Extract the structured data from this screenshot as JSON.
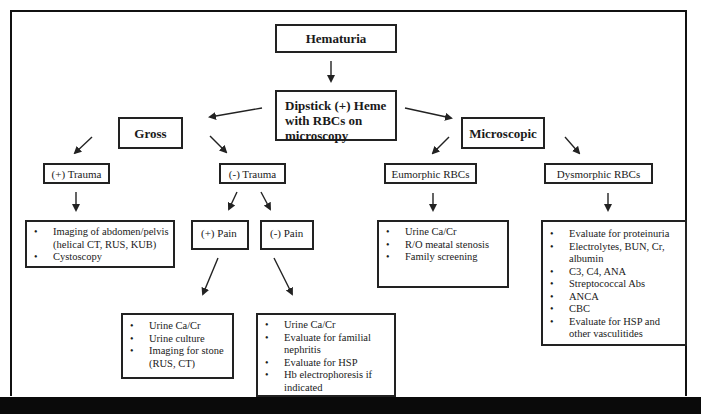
{
  "diagram": {
    "root": {
      "label": "Hematuria"
    },
    "dipstick": {
      "label": "Dipstick (+) Heme with RBCs on microscopy"
    },
    "gross": {
      "label": "Gross",
      "positive_trauma": {
        "label": "(+) Trauma",
        "items": [
          "Imaging of abdomen/pelvis (helical CT, RUS, KUB)",
          "Cystoscopy"
        ]
      },
      "negative_trauma": {
        "label": "(-) Trauma",
        "positive_pain": {
          "label": "(+) Pain",
          "items": [
            "Urine Ca/Cr",
            "Urine culture",
            "Imaging for stone (RUS, CT)"
          ]
        },
        "negative_pain": {
          "label": "(-) Pain",
          "items": [
            "Urine Ca/Cr",
            "Evaluate for familial nephritis",
            "Evaluate for HSP",
            "Hb electrophoresis  if indicated"
          ]
        }
      }
    },
    "microscopic": {
      "label": "Microscopic",
      "eumorphic": {
        "label": "Eumorphic RBCs",
        "items": [
          "Urine Ca/Cr",
          "R/O meatal stenosis",
          "Family screening"
        ]
      },
      "dysmorphic": {
        "label": "Dysmorphic RBCs",
        "items": [
          "Evaluate for proteinuria",
          "Electrolytes, BUN, Cr, albumin",
          "C3, C4, ANA",
          "Streptococcal Abs",
          "ANCA",
          "CBC",
          "Evaluate for HSP and other vasculitides"
        ]
      }
    }
  },
  "colors": {
    "line": "#222222",
    "background": "#ffffff",
    "bottom_bar": "#0a0a0a"
  }
}
